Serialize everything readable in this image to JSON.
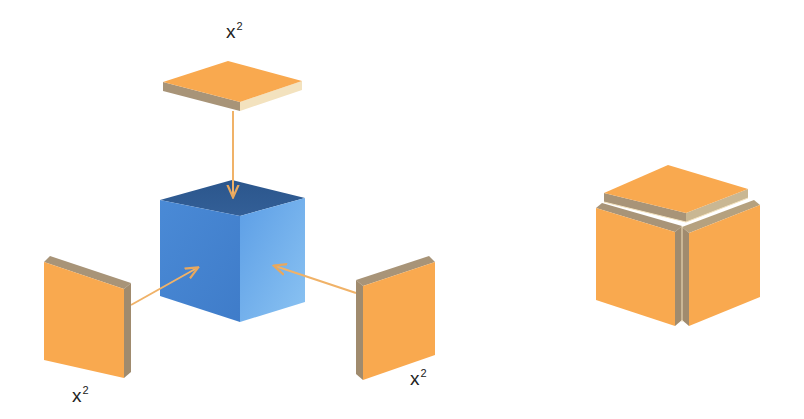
{
  "diagram": {
    "labels": {
      "top_plate": {
        "base": "x",
        "exponent": "2"
      },
      "left_plate": {
        "base": "x",
        "exponent": "2"
      },
      "right_plate": {
        "base": "x",
        "exponent": "2"
      }
    },
    "colors": {
      "plate_face": "#F9A94F",
      "plate_edge_dark": "#A89478",
      "plate_edge_light": "#F3E2BE",
      "cube_top": "#2E5E99",
      "cube_left": "#4F8FDB",
      "cube_right": "#6AAAEB",
      "arrow": "#F0B268",
      "label_text": "#222222",
      "background": "#FFFFFF"
    }
  }
}
